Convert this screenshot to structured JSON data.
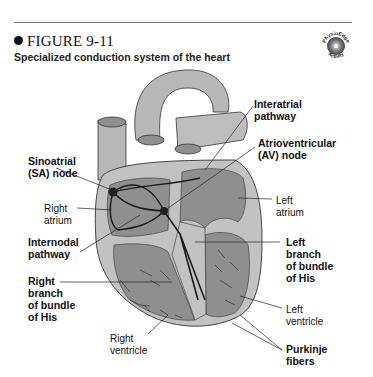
{
  "figure": {
    "number": "FIGURE 9-11",
    "title": "Specialized conduction system of the heart",
    "badge_icon": "physioedge-activity-cd-icon",
    "badge_text_top": "PhysioEdge",
    "badge_text_bottom": "Activity"
  },
  "labels": {
    "interatrial": "Interatrial\npathway",
    "av_node": "Atrioventricular\n(AV) node",
    "sa_node": "Sinoatrial\n(SA) node",
    "right_atrium": "Right\natrium",
    "left_atrium": "Left\natrium",
    "internodal": "Internodal\npathway",
    "left_branch": "Left\nbranch\nof bundle\nof His",
    "right_branch": "Right\nbranch\nof bundle\nof His",
    "left_ventricle": "Left\nventricle",
    "right_ventricle": "Right\nventricle",
    "purkinje": "Purkinje\nfibers"
  },
  "colors": {
    "outer_wall": "#c2c2c2",
    "chamber": "#8f8f8f",
    "vessel": "#b5b5b5",
    "pathway": "#1a1a1a"
  }
}
